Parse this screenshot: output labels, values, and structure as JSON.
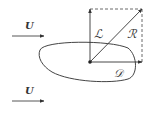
{
  "diagram": {
    "type": "force-decomposition",
    "flow": {
      "top_label": "U",
      "bottom_label": "U"
    },
    "forces": {
      "lift_label": "ℒ",
      "drag_label": "𝒟",
      "resultant_label": "ℛ"
    },
    "colors": {
      "stroke": "#333333",
      "background": "#ffffff"
    }
  }
}
